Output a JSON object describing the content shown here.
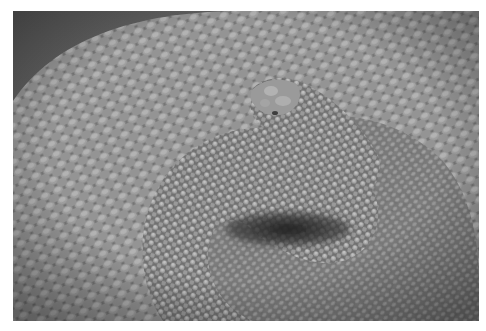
{
  "image": {
    "subject": "coiled rattlesnake close-up",
    "style": "grayscale photograph",
    "bounds": {
      "x": 13,
      "y": 11,
      "width": 466,
      "height": 310
    },
    "page_background": "#ffffff",
    "colors": {
      "background_dark": "#5a5a5a",
      "body_mid": "#7d7d7d",
      "scale_highlight": "#b4b4b4",
      "scale_shadow": "#4a4a4a",
      "coil_shadow": "#262626"
    },
    "regions": [
      {
        "name": "outer-coil",
        "description": "large outer body loop filling frame"
      },
      {
        "name": "head",
        "description": "snake head resting on coil, upper center-right"
      },
      {
        "name": "inner-coil",
        "description": "inner loop of body curling under head"
      },
      {
        "name": "coil-shadow",
        "description": "dark shadow gap under inner coil"
      }
    ]
  }
}
